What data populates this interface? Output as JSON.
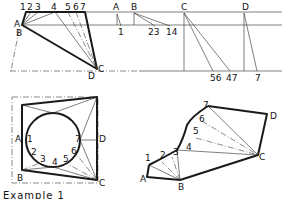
{
  "figure": {
    "caption": "Example 1",
    "panels": [
      {
        "name": "plan-view-triangulation",
        "labels": [
          "1",
          "2",
          "3",
          "4",
          "5",
          "6",
          "7",
          "A",
          "B",
          "C",
          "D"
        ]
      },
      {
        "name": "true-length-diagram",
        "labels": [
          "A",
          "B",
          "1",
          "23",
          "14",
          "C",
          "D",
          "56",
          "47",
          "7"
        ]
      },
      {
        "name": "circle-to-square-plan",
        "labels": [
          "A",
          "1",
          "2",
          "3",
          "4",
          "5",
          "6",
          "7",
          "D",
          "B",
          "C"
        ]
      },
      {
        "name": "development-pattern",
        "labels": [
          "1",
          "2",
          "3",
          "4",
          "5",
          "6",
          "7",
          "A",
          "B",
          "C",
          "D"
        ]
      }
    ]
  }
}
